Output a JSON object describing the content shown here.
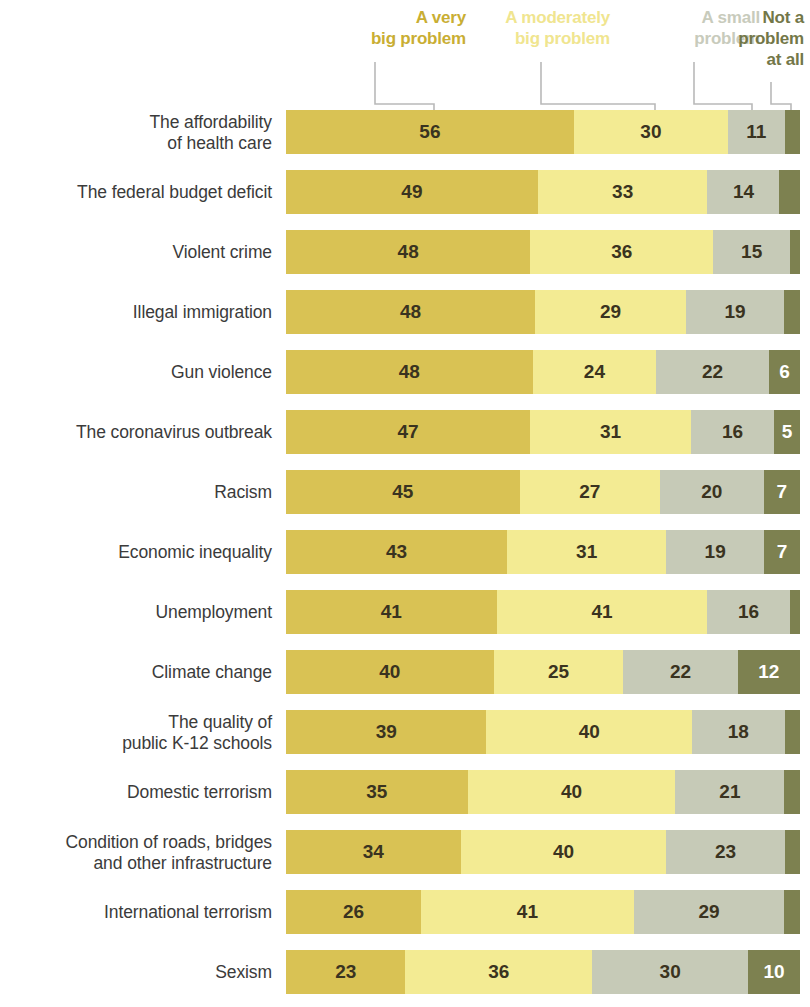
{
  "legend": [
    {
      "label": "A very\nbig problem",
      "color": "#c9ae33",
      "bar_color": "#d9c254"
    },
    {
      "label": "A moderately\nbig problem",
      "color": "#f0e58f",
      "bar_color": "#f3eb93"
    },
    {
      "label": "A small\nproblem",
      "color": "#c8cbbc",
      "bar_color": "#c6cab7"
    },
    {
      "label": "Not a\nproblem\nat all",
      "color": "#737748",
      "bar_color": "#7d8150"
    }
  ],
  "chart_data": {
    "type": "bar",
    "subtype": "stacked-horizontal-100",
    "title": "",
    "xlabel": "",
    "ylabel": "",
    "xlim": [
      0,
      100
    ],
    "grid": false,
    "legend_position": "top",
    "legend_entries": [
      "A very big problem",
      "A moderately big problem",
      "A small problem",
      "Not a problem at all"
    ],
    "series": [
      {
        "name": "A very big problem",
        "color": "#d9c254",
        "values": [
          56,
          49,
          48,
          48,
          48,
          47,
          45,
          43,
          41,
          40,
          39,
          35,
          34,
          26,
          23
        ]
      },
      {
        "name": "A moderately big problem",
        "color": "#f3eb93",
        "values": [
          30,
          33,
          36,
          29,
          24,
          31,
          27,
          31,
          41,
          25,
          40,
          40,
          40,
          41,
          36
        ]
      },
      {
        "name": "A small problem",
        "color": "#c6cab7",
        "values": [
          11,
          14,
          15,
          19,
          22,
          16,
          20,
          19,
          16,
          22,
          18,
          21,
          23,
          29,
          30
        ]
      },
      {
        "name": "Not a problem at all",
        "color": "#7d8150",
        "values": [
          3,
          4,
          2,
          3,
          6,
          5,
          7,
          7,
          2,
          12,
          3,
          3,
          3,
          3,
          10
        ]
      }
    ],
    "categories": [
      "The affordability of health care",
      "The federal budget deficit",
      "Violent crime",
      "Illegal immigration",
      "Gun violence",
      "The coronavirus outbreak",
      "Racism",
      "Economic inequality",
      "Unemployment",
      "Climate change",
      "The quality of public K-12 schools",
      "Domestic terrorism",
      "Condition of roads, bridges and other infrastructure",
      "International terrorism",
      "Sexism"
    ]
  },
  "rows": [
    {
      "label_lines": [
        "The affordability",
        "of health care"
      ],
      "segments": [
        {
          "value": 56,
          "pct": 56,
          "show": true
        },
        {
          "value": 30,
          "pct": 30,
          "show": true
        },
        {
          "value": 11,
          "pct": 11,
          "show": true
        },
        {
          "value": 3,
          "pct": 3,
          "show": false
        }
      ]
    },
    {
      "label_lines": [
        "The federal budget deficit"
      ],
      "segments": [
        {
          "value": 49,
          "pct": 49,
          "show": true
        },
        {
          "value": 33,
          "pct": 33,
          "show": true
        },
        {
          "value": 14,
          "pct": 14,
          "show": true
        },
        {
          "value": 4,
          "pct": 4,
          "show": false
        }
      ]
    },
    {
      "label_lines": [
        "Violent crime"
      ],
      "segments": [
        {
          "value": 48,
          "pct": 48,
          "show": true
        },
        {
          "value": 36,
          "pct": 36,
          "show": true
        },
        {
          "value": 15,
          "pct": 15,
          "show": true
        },
        {
          "value": 2,
          "pct": 2,
          "show": false
        }
      ]
    },
    {
      "label_lines": [
        "Illegal immigration"
      ],
      "segments": [
        {
          "value": 48,
          "pct": 48,
          "show": true
        },
        {
          "value": 29,
          "pct": 29,
          "show": true
        },
        {
          "value": 19,
          "pct": 19,
          "show": true
        },
        {
          "value": 3,
          "pct": 3,
          "show": false
        }
      ]
    },
    {
      "label_lines": [
        "Gun violence"
      ],
      "segments": [
        {
          "value": 48,
          "pct": 48,
          "show": true
        },
        {
          "value": 24,
          "pct": 24,
          "show": true
        },
        {
          "value": 22,
          "pct": 22,
          "show": true
        },
        {
          "value": 6,
          "pct": 6,
          "show": true
        }
      ]
    },
    {
      "label_lines": [
        "The coronavirus outbreak"
      ],
      "segments": [
        {
          "value": 47,
          "pct": 47,
          "show": true
        },
        {
          "value": 31,
          "pct": 31,
          "show": true
        },
        {
          "value": 16,
          "pct": 16,
          "show": true
        },
        {
          "value": 5,
          "pct": 5,
          "show": true
        }
      ]
    },
    {
      "label_lines": [
        "Racism"
      ],
      "segments": [
        {
          "value": 45,
          "pct": 45,
          "show": true
        },
        {
          "value": 27,
          "pct": 27,
          "show": true
        },
        {
          "value": 20,
          "pct": 20,
          "show": true
        },
        {
          "value": 7,
          "pct": 7,
          "show": true
        }
      ]
    },
    {
      "label_lines": [
        "Economic inequality"
      ],
      "segments": [
        {
          "value": 43,
          "pct": 43,
          "show": true
        },
        {
          "value": 31,
          "pct": 31,
          "show": true
        },
        {
          "value": 19,
          "pct": 19,
          "show": true
        },
        {
          "value": 7,
          "pct": 7,
          "show": true
        }
      ]
    },
    {
      "label_lines": [
        "Unemployment"
      ],
      "segments": [
        {
          "value": 41,
          "pct": 41,
          "show": true
        },
        {
          "value": 41,
          "pct": 41,
          "show": true
        },
        {
          "value": 16,
          "pct": 16,
          "show": true
        },
        {
          "value": 2,
          "pct": 2,
          "show": false
        }
      ]
    },
    {
      "label_lines": [
        "Climate change"
      ],
      "segments": [
        {
          "value": 40,
          "pct": 40,
          "show": true
        },
        {
          "value": 25,
          "pct": 25,
          "show": true
        },
        {
          "value": 22,
          "pct": 22,
          "show": true
        },
        {
          "value": 12,
          "pct": 12,
          "show": true
        }
      ]
    },
    {
      "label_lines": [
        "The quality of",
        "public K-12 schools"
      ],
      "segments": [
        {
          "value": 39,
          "pct": 39,
          "show": true
        },
        {
          "value": 40,
          "pct": 40,
          "show": true
        },
        {
          "value": 18,
          "pct": 18,
          "show": true
        },
        {
          "value": 3,
          "pct": 3,
          "show": false
        }
      ]
    },
    {
      "label_lines": [
        "Domestic terrorism"
      ],
      "segments": [
        {
          "value": 35,
          "pct": 35,
          "show": true
        },
        {
          "value": 40,
          "pct": 40,
          "show": true
        },
        {
          "value": 21,
          "pct": 21,
          "show": true
        },
        {
          "value": 3,
          "pct": 3,
          "show": false
        }
      ]
    },
    {
      "label_lines": [
        "Condition of roads, bridges",
        "and other infrastructure"
      ],
      "segments": [
        {
          "value": 34,
          "pct": 34,
          "show": true
        },
        {
          "value": 40,
          "pct": 40,
          "show": true
        },
        {
          "value": 23,
          "pct": 23,
          "show": true
        },
        {
          "value": 3,
          "pct": 3,
          "show": false
        }
      ]
    },
    {
      "label_lines": [
        "International terrorism"
      ],
      "segments": [
        {
          "value": 26,
          "pct": 26,
          "show": true
        },
        {
          "value": 41,
          "pct": 41,
          "show": true
        },
        {
          "value": 29,
          "pct": 29,
          "show": true
        },
        {
          "value": 3,
          "pct": 3,
          "show": false
        }
      ]
    },
    {
      "label_lines": [
        "Sexism"
      ],
      "segments": [
        {
          "value": 23,
          "pct": 23,
          "show": true
        },
        {
          "value": 36,
          "pct": 36,
          "show": true
        },
        {
          "value": 30,
          "pct": 30,
          "show": true
        },
        {
          "value": 10,
          "pct": 10,
          "show": true
        }
      ]
    }
  ]
}
